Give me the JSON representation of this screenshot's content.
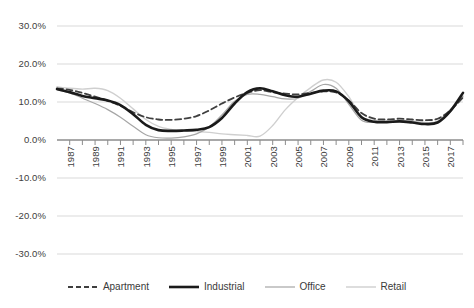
{
  "chart_data": {
    "type": "line",
    "title": "",
    "xlabel": "",
    "ylabel": "",
    "ylim": [
      -30,
      30
    ],
    "xlim": [
      1986,
      2018
    ],
    "grid": true,
    "legend_position": "bottom",
    "ytick_labels": [
      "30.0%",
      "20.0%",
      "10.0%",
      "0.0%",
      "-10.0%",
      "-20.0%",
      "-30.0%"
    ],
    "ytick_values": [
      30,
      20,
      10,
      0,
      -10,
      -20,
      -30
    ],
    "xtick_labels": [
      "1987",
      "1989",
      "1991",
      "1993",
      "1995",
      "1997",
      "1999",
      "2001",
      "2003",
      "2005",
      "2007",
      "2009",
      "2011",
      "2013",
      "2015",
      "2017"
    ],
    "x": [
      1986,
      1987,
      1988,
      1989,
      1990,
      1991,
      1992,
      1993,
      1994,
      1995,
      1996,
      1997,
      1998,
      1999,
      2000,
      2001,
      2002,
      2003,
      2004,
      2005,
      2006,
      2007,
      2008,
      2009,
      2010,
      2011,
      2012,
      2013,
      2014,
      2015,
      2016,
      2017,
      2018
    ],
    "series": [
      {
        "name": "Apartment",
        "color": "#3f3f3f",
        "style": "dashed",
        "width": 1.8,
        "values": [
          13.6,
          13.2,
          12.4,
          11.4,
          10.3,
          9.0,
          7.3,
          6.0,
          5.4,
          5.3,
          5.6,
          6.3,
          7.8,
          9.6,
          11.2,
          12.4,
          13.1,
          12.6,
          12.2,
          12.0,
          12.4,
          12.8,
          12.5,
          10.4,
          7.1,
          5.6,
          5.4,
          5.6,
          5.4,
          5.2,
          5.6,
          7.8,
          11.2
        ]
      },
      {
        "name": "Industrial",
        "color": "#1a1a1a",
        "style": "solid",
        "width": 2.6,
        "values": [
          13.4,
          12.6,
          11.6,
          11.0,
          10.4,
          9.2,
          6.8,
          4.0,
          2.6,
          2.4,
          2.5,
          2.7,
          3.4,
          5.8,
          9.6,
          12.6,
          13.6,
          12.8,
          11.8,
          11.4,
          12.2,
          13.0,
          12.8,
          10.2,
          6.0,
          4.8,
          4.7,
          4.9,
          4.6,
          4.2,
          4.6,
          7.6,
          12.4
        ]
      },
      {
        "name": "Office",
        "color": "#a6a6a6",
        "style": "solid",
        "width": 1.2,
        "values": [
          13.2,
          12.4,
          11.0,
          9.6,
          8.0,
          6.0,
          3.6,
          1.4,
          0.6,
          0.5,
          0.8,
          1.6,
          3.4,
          6.6,
          10.2,
          12.0,
          12.0,
          11.4,
          10.8,
          11.0,
          12.8,
          14.6,
          13.6,
          9.4,
          5.2,
          4.6,
          4.8,
          5.0,
          4.8,
          4.4,
          4.8,
          7.4,
          11.6
        ]
      },
      {
        "name": "Retail",
        "color": "#cfcfcf",
        "style": "solid",
        "width": 1.4,
        "values": [
          14.0,
          13.6,
          13.4,
          13.6,
          13.0,
          11.0,
          8.2,
          5.4,
          3.6,
          2.8,
          2.4,
          2.2,
          2.0,
          1.6,
          1.4,
          1.2,
          1.0,
          3.8,
          8.0,
          11.2,
          13.8,
          15.8,
          15.2,
          11.4,
          6.2,
          5.2,
          5.0,
          5.2,
          5.0,
          4.6,
          5.0,
          8.0,
          11.4
        ]
      }
    ],
    "legend": [
      {
        "label": "Apartment",
        "marker": "dashed-dark"
      },
      {
        "label": "Industrial",
        "marker": "solid-thick-black"
      },
      {
        "label": "Office",
        "marker": "solid-thin-gray"
      },
      {
        "label": "Retail",
        "marker": "solid-thin-lightgray"
      }
    ]
  }
}
